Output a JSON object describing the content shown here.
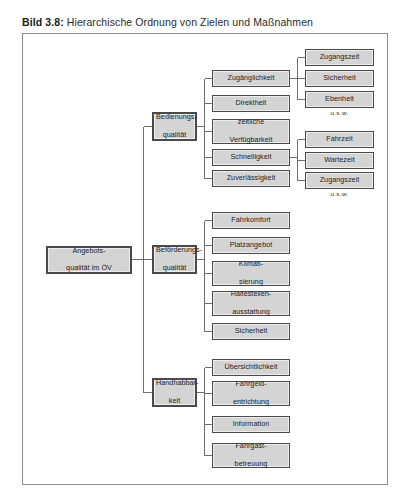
{
  "caption": {
    "label": "Bild 3.8:",
    "text": "Hierarchische Ordnung von Zielen und Maßnahmen"
  },
  "diagram": {
    "type": "hierarchy-tree",
    "orientation": "left-to-right",
    "root": {
      "id": "root",
      "label": "Angebots-\nqualität im ÖV",
      "line1": "Angebots-",
      "line2": "qualität im ÖV"
    },
    "level2": [
      {
        "id": "bedienungsqualitaet",
        "line1": "Bedienungs-",
        "line2": "qualität"
      },
      {
        "id": "befoerderungsqualitaet",
        "line1": "Beförderungs-",
        "line2": "qualität"
      },
      {
        "id": "handhabbarkeit",
        "line1": "Handhabbar-",
        "line2": "keit"
      }
    ],
    "level3": {
      "bedienungsqualitaet": [
        {
          "id": "zugaenglichkeit",
          "line1": "Zugänglichkeit",
          "line2": ""
        },
        {
          "id": "direktheit",
          "line1": "Direktheit",
          "line2": ""
        },
        {
          "id": "zeitliche-verfuegbarkeit",
          "line1": "zeitliche",
          "line2": "Verfügbarkeit"
        },
        {
          "id": "schnelligkeit",
          "line1": "Schnelligkeit",
          "line2": ""
        },
        {
          "id": "zuverlaessigkeit",
          "line1": "Zuverlässigkeit",
          "line2": ""
        }
      ],
      "befoerderungsqualitaet": [
        {
          "id": "fahrkomfort",
          "line1": "Fahrkomfort",
          "line2": ""
        },
        {
          "id": "platzangebot",
          "line1": "Platzangebot",
          "line2": ""
        },
        {
          "id": "klimatisierung",
          "line1": "Klimati-",
          "line2": "sierung"
        },
        {
          "id": "haltestellenausstattung",
          "line1": "Haltestellen-",
          "line2": "ausstattung"
        },
        {
          "id": "sicherheit-bef",
          "line1": "Sicherheit",
          "line2": ""
        }
      ],
      "handhabbarkeit": [
        {
          "id": "uebersichtlichkeit",
          "line1": "Übersichtlichkeit",
          "line2": ""
        },
        {
          "id": "fahrgeldentrichtung",
          "line1": "Fahrgeld-",
          "line2": "entrichtung"
        },
        {
          "id": "information",
          "line1": "Information",
          "line2": ""
        },
        {
          "id": "fahrgastbetreuung",
          "line1": "Fahrgast-",
          "line2": "betreuung"
        }
      ]
    },
    "level4": {
      "zugaenglichkeit": {
        "items": [
          {
            "id": "zugangszeit-1",
            "line1": "Zugangszeit",
            "line2": ""
          },
          {
            "id": "sicherheit-zug",
            "line1": "Sicherheit",
            "line2": ""
          },
          {
            "id": "ebenheit",
            "line1": "Ebenheit",
            "line2": ""
          }
        ],
        "more": "u.s.w."
      },
      "schnelligkeit": {
        "items": [
          {
            "id": "fahrzeit",
            "line1": "Fahrzeit",
            "line2": ""
          },
          {
            "id": "wartezeit",
            "line1": "Wartezeit",
            "line2": ""
          },
          {
            "id": "zugangszeit-2",
            "line1": "Zugangszeit",
            "line2": ""
          }
        ],
        "more": "u.s.w."
      }
    }
  },
  "colors": {
    "node_fill": "#d4d4d4",
    "node_border": "#4a4a4a",
    "frame_border": "#8d8d8d",
    "line": "#6e6e6e",
    "text": "#1d1d1d"
  }
}
